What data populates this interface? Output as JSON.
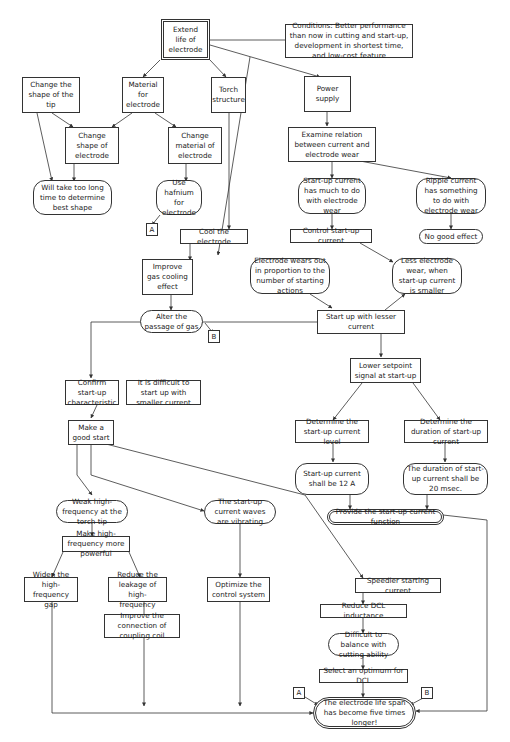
{
  "diagram": {
    "title_node": "Extend life of electrode",
    "conditions": "Conditions: Better performance than now in cutting and start-up, development in shortest time, and low-cost feature",
    "nodes": {
      "change_tip": "Change the shape of the tip",
      "material": "Material for electrode",
      "torch": "Torch structure",
      "power": "Power supply",
      "change_shape": "Change shape of electrode",
      "change_material": "Change material of electrode",
      "examine": "Examine relation between current and electrode wear",
      "too_long": "Will take too long time to determine best shape",
      "hafnium": "Use hafnium for electrode",
      "startup_wear": "Start-up current has much to do with electrode wear",
      "ripple": "Ripple current has something to do with electrode wear",
      "cool": "Cool the electrode",
      "control": "Control start-up current",
      "no_good": "No good effect",
      "improve_gas": "Improve gas cooling effect",
      "wears_out": "Electrode wears out in proportion to the number of starting actions",
      "less_wear": "Less electrode wear, when start-up current is smaller",
      "alter_gas": "Alter the passage of gas",
      "lesser": "Start up with lesser current",
      "lower_setpoint": "Lower setpoint signal at start-up",
      "confirm": "Confirm start-up characteristic",
      "difficult_start": "It is difficult to start up with smaller current",
      "good_start": "Make a good start",
      "det_level": "Determine the start-up current level",
      "det_duration": "Determine the duration of start-up current",
      "level_12a": "Start-up current shall be 12 A",
      "duration_20": "The duration of start-up current shall be 20 msec.",
      "provide": "Provide the start-up current function",
      "weak_hf": "Weak high-frequency at the torch tip",
      "vibrating": "The start-up current waves are vibrating",
      "more_powerful": "Make high-frequency more powerful",
      "widen": "Widen the high-frequency gap",
      "reduce_leak": "Reduce the leakage of high-frequency",
      "optimize": "Optimize the control system",
      "coupling": "Improve the connection of coupling coil",
      "speedier": "Speedier starting current",
      "reduce_dcl": "Reduce DCL inductance",
      "balance": "Difficult to balance with cutting ability",
      "select_dcl": "Select an optimum for DCL",
      "result": "The electrode life span has become five times longer!"
    },
    "connectors": {
      "a": "A",
      "b": "B"
    }
  }
}
